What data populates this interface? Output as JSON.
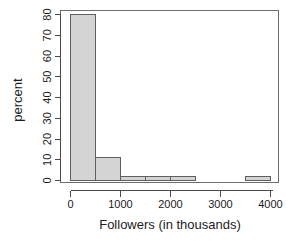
{
  "chart_data": {
    "type": "bar",
    "subtype": "histogram",
    "title": "",
    "xlabel": "Followers (in thousands)",
    "ylabel": "percent",
    "xlim": [
      -50,
      4150
    ],
    "ylim": [
      0,
      83
    ],
    "bin_width": 500,
    "grid": false,
    "legend": false,
    "legend_position": "none",
    "bar_fill_color": "#d4d4d4",
    "bar_border_color": "#5f5f5f",
    "xticks": [
      0,
      1000,
      2000,
      3000,
      4000
    ],
    "xtick_labels": [
      "0",
      "1000",
      "2000",
      "3000",
      "4000"
    ],
    "yticks": [
      0,
      10,
      20,
      30,
      40,
      50,
      60,
      70,
      80
    ],
    "ytick_labels": [
      "0",
      "10",
      "20",
      "30",
      "40",
      "50",
      "60",
      "70",
      "80"
    ],
    "bins": [
      {
        "start": 0,
        "end": 500,
        "value": 80
      },
      {
        "start": 500,
        "end": 1000,
        "value": 11
      },
      {
        "start": 1000,
        "end": 1500,
        "value": 2
      },
      {
        "start": 1500,
        "end": 2000,
        "value": 2
      },
      {
        "start": 2000,
        "end": 2500,
        "value": 2
      },
      {
        "start": 2500,
        "end": 3000,
        "value": 0
      },
      {
        "start": 3000,
        "end": 3500,
        "value": 0
      },
      {
        "start": 3500,
        "end": 4000,
        "value": 2
      }
    ],
    "categories": [
      "0-500",
      "500-1000",
      "1000-1500",
      "1500-2000",
      "2000-2500",
      "2500-3000",
      "3000-3500",
      "3500-4000"
    ],
    "values": [
      80,
      11,
      2,
      2,
      2,
      0,
      0,
      2
    ]
  },
  "axis": {
    "x_title": "Followers (in thousands)",
    "y_title": "percent"
  }
}
